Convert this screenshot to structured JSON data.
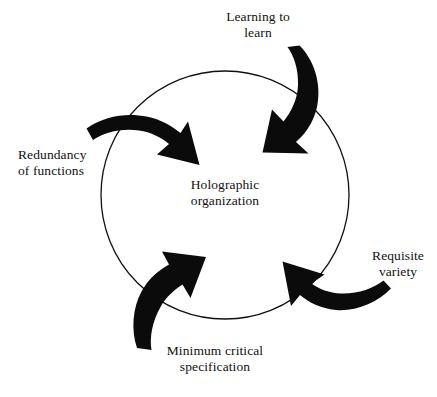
{
  "diagram": {
    "type": "cycle-diagram",
    "background_color": "#ffffff",
    "ink_color": "#111111",
    "center": {
      "label_line_1": "Holographic",
      "label_line_2": "organization"
    },
    "circle": {
      "center_x": 225,
      "center_y": 195,
      "radius": 124,
      "stroke_color": "#111111"
    },
    "nodes": [
      {
        "id": "learning-to-learn",
        "position": "top",
        "label_line_1": "Learning to",
        "label_line_2": "learn",
        "arrow": "curved-arrow-top-right-inward"
      },
      {
        "id": "requisite-variety",
        "position": "right",
        "label_line_1": "Requisite",
        "label_line_2": "variety",
        "arrow": "curved-arrow-bottom-right-inward"
      },
      {
        "id": "minimum-critical-specification",
        "position": "bottom",
        "label_line_1": "Minimum critical",
        "label_line_2": "specification",
        "arrow": "curved-arrow-bottom-left-inward"
      },
      {
        "id": "redundancy-of-functions",
        "position": "left",
        "label_line_1": "Redundancy",
        "label_line_2": "of functions",
        "arrow": "curved-arrow-top-left-inward"
      }
    ]
  }
}
